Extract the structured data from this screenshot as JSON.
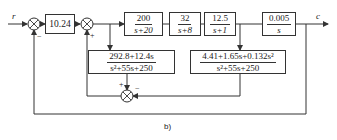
{
  "diagram": {
    "caption": "b)",
    "input_label": "r",
    "output_label": "c",
    "blocks": {
      "gain": {
        "text": "10.24"
      },
      "g1": {
        "num": "200",
        "den": "s+20"
      },
      "g2": {
        "num": "32",
        "den": "s+8"
      },
      "g3": {
        "num": "12.5",
        "den": "s+1"
      },
      "g4": {
        "num": "0.005",
        "den": "s"
      },
      "h1": {
        "num": "292.8+12.4s",
        "den": "s²+55s+250"
      },
      "h2": {
        "num": "4.41+1.65s+0.132s²",
        "den": "s²+55s+250"
      }
    },
    "signs": {
      "sum1_feedback": "−",
      "sum2_feedback": "+",
      "sum3_left": "+",
      "sum3_right": "−"
    }
  }
}
